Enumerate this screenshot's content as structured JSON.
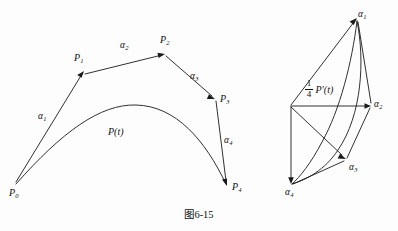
{
  "figure": {
    "caption": "图6-15",
    "left_diagram": {
      "name": "bezier-control-polygon-and-curve",
      "curve_label": "P(t)",
      "control_points": [
        {
          "id": "P0",
          "base": "P",
          "sub": "0",
          "x": 14,
          "y": 190
        },
        {
          "id": "P1",
          "base": "P",
          "sub": "1",
          "x": 84,
          "y": 71
        },
        {
          "id": "P2",
          "base": "P",
          "sub": "2",
          "x": 165,
          "y": 52
        },
        {
          "id": "P3",
          "base": "P",
          "sub": "3",
          "x": 215,
          "y": 100
        },
        {
          "id": "P4",
          "base": "P",
          "sub": "4",
          "x": 228,
          "y": 188
        }
      ],
      "vectors": [
        {
          "id": "a1",
          "base": "α",
          "sub": "1",
          "label_x": 38,
          "label_y": 112
        },
        {
          "id": "a2",
          "base": "α",
          "sub": "2",
          "label_x": 120,
          "label_y": 41
        },
        {
          "id": "a3",
          "base": "α",
          "sub": "3",
          "label_x": 190,
          "label_y": 72
        },
        {
          "id": "a4",
          "base": "α",
          "sub": "4",
          "label_x": 224,
          "label_y": 136
        }
      ]
    },
    "right_diagram": {
      "name": "hodograph-derivative-polygon",
      "scaled_derivative": {
        "numerator": "1",
        "denominator": "4",
        "expression": "P′(t)"
      },
      "vectors": [
        {
          "id": "a1",
          "base": "α",
          "sub": "1",
          "label_x": 358,
          "label_y": 10
        },
        {
          "id": "a2",
          "base": "α",
          "sub": "2",
          "label_x": 374,
          "label_y": 100
        },
        {
          "id": "a3",
          "base": "α",
          "sub": "3",
          "label_x": 349,
          "label_y": 167
        },
        {
          "id": "a4",
          "base": "α",
          "sub": "4",
          "label_x": 285,
          "label_y": 190
        }
      ]
    }
  },
  "colors": {
    "ink": "#1a1a1a",
    "background": "#fdfdfd"
  }
}
